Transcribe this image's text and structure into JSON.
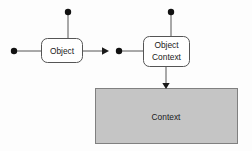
{
  "diagram": {
    "background_color": "#fdfdfd",
    "stroke_color": "#555555",
    "node_fill": "#ffffff",
    "region_fill": "#c5c5c5",
    "region_stroke": "#808080",
    "dot_color": "#111111",
    "nodes": [
      {
        "id": "object",
        "label": "Object",
        "shape": "rounded-rectangle",
        "x": 41,
        "y": 38,
        "width": 42,
        "height": 25
      },
      {
        "id": "object-context",
        "label_line1": "Object",
        "label_line2": "Context",
        "shape": "rounded-rectangle",
        "x": 143,
        "y": 36,
        "width": 47,
        "height": 31
      }
    ],
    "region": {
      "id": "context",
      "label": "Context",
      "shape": "rectangle",
      "x": 95,
      "y": 88,
      "width": 143,
      "height": 56
    },
    "terminals": [
      {
        "id": "terminal-left-object",
        "x": 14,
        "y": 51,
        "radius": 3.2
      },
      {
        "id": "terminal-top-object",
        "x": 68,
        "y": 12,
        "radius": 3.2
      },
      {
        "id": "terminal-left-object-context",
        "x": 119,
        "y": 51,
        "radius": 3.2
      },
      {
        "id": "terminal-top-object-context",
        "x": 171,
        "y": 12,
        "radius": 3.2
      }
    ],
    "connectors": [
      {
        "id": "connector-left-to-object",
        "from": "terminal-left-object",
        "to": "object",
        "arrow": false
      },
      {
        "id": "connector-top-to-object",
        "from": "terminal-top-object",
        "to": "object",
        "arrow": false
      },
      {
        "id": "connector-object-to-right",
        "from": "object",
        "to": "terminal-left-object-context",
        "arrow": true
      },
      {
        "id": "connector-left-to-object-context",
        "from": "terminal-left-object-context",
        "to": "object-context",
        "arrow": false
      },
      {
        "id": "connector-top-to-object-context",
        "from": "terminal-top-object-context",
        "to": "object-context",
        "arrow": false
      },
      {
        "id": "connector-object-context-to-context",
        "from": "object-context",
        "to": "context",
        "arrow": true
      }
    ]
  }
}
